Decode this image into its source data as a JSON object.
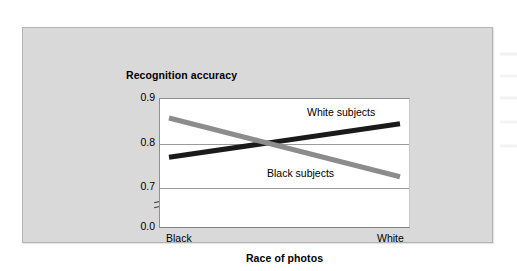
{
  "figure": {
    "y_axis_title": "Recognition accuracy",
    "x_axis_title": "Race of photos"
  },
  "chart_data": {
    "type": "line",
    "title": "",
    "xlabel": "Race of photos",
    "ylabel": "Recognition accuracy",
    "categories": [
      "Black",
      "White"
    ],
    "x_tick_labels": [
      "Black",
      "White"
    ],
    "y_tick_labels": [
      "0.9",
      "0.8",
      "0.7",
      "0.0"
    ],
    "y_tick_values": [
      0.9,
      0.8,
      0.7,
      0.0
    ],
    "ylim": [
      0.7,
      0.9
    ],
    "axis_break": true,
    "axis_break_between": [
      0.0,
      0.7
    ],
    "grid": "horizontal",
    "legend": "inline-labels",
    "series": [
      {
        "name": "White subjects",
        "color": "#1a1a1a",
        "values": [
          0.767,
          0.842
        ]
      },
      {
        "name": "Black subjects",
        "color": "#8c8c8c",
        "values": [
          0.855,
          0.723
        ]
      }
    ],
    "annotations": [
      {
        "text": "White subjects",
        "series": "White subjects"
      },
      {
        "text": "Black subjects",
        "series": "Black subjects"
      }
    ]
  },
  "colors": {
    "panel_background": "#d9d9d9",
    "plot_background": "#ffffff",
    "gridline": "#9a9a9a",
    "series_white_subjects": "#1a1a1a",
    "series_black_subjects": "#8c8c8c"
  }
}
